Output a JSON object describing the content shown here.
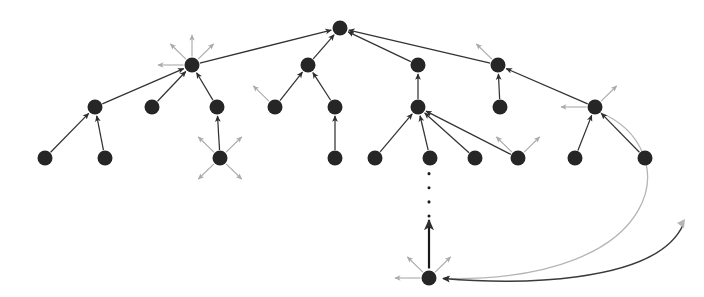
{
  "figure": {
    "title": "",
    "caption": "",
    "type": "directed-graph-tree",
    "background_color": "#ffffff",
    "node_color": "#262626",
    "edge_color_primary": "#333333",
    "edge_color_secondary": "#aaaaaa",
    "dotted_edge_color": "#1a1a1a",
    "curve_edge_color": "#b5b5b5",
    "node_radius": 7.5,
    "width": 704,
    "height": 297
  },
  "graph_data": {
    "type": "node-link-diagram",
    "nodes": [
      {
        "id": "root",
        "label": "",
        "x": 340,
        "y": 28
      },
      {
        "id": "n_l1",
        "label": "",
        "x": 192,
        "y": 65
      },
      {
        "id": "n_c1",
        "label": "",
        "x": 308,
        "y": 65
      },
      {
        "id": "n_r1",
        "label": "",
        "x": 418,
        "y": 65
      },
      {
        "id": "n_r2",
        "label": "",
        "x": 498,
        "y": 65
      },
      {
        "id": "n_l2",
        "label": "",
        "x": 95,
        "y": 107
      },
      {
        "id": "n_l3",
        "label": "",
        "x": 152,
        "y": 107
      },
      {
        "id": "n_l4",
        "label": "",
        "x": 217,
        "y": 107
      },
      {
        "id": "n_c2",
        "label": "",
        "x": 275,
        "y": 107
      },
      {
        "id": "n_c3",
        "label": "",
        "x": 335,
        "y": 107
      },
      {
        "id": "n_h1",
        "label": "",
        "x": 418,
        "y": 107
      },
      {
        "id": "n_r3",
        "label": "",
        "x": 500,
        "y": 107
      },
      {
        "id": "n_h2",
        "label": "",
        "x": 595,
        "y": 107
      },
      {
        "id": "n_b1",
        "label": "",
        "x": 45,
        "y": 158
      },
      {
        "id": "n_b2",
        "label": "",
        "x": 105,
        "y": 158
      },
      {
        "id": "n_b3",
        "label": "",
        "x": 220,
        "y": 158
      },
      {
        "id": "n_b4",
        "label": "",
        "x": 335,
        "y": 158
      },
      {
        "id": "n_b5",
        "label": "",
        "x": 375,
        "y": 158
      },
      {
        "id": "n_b6",
        "label": "",
        "x": 430,
        "y": 158
      },
      {
        "id": "n_b7",
        "label": "",
        "x": 475,
        "y": 158
      },
      {
        "id": "n_b8",
        "label": "",
        "x": 518,
        "y": 158
      },
      {
        "id": "n_b9",
        "label": "",
        "x": 575,
        "y": 158
      },
      {
        "id": "n_b10",
        "label": "",
        "x": 645,
        "y": 158
      },
      {
        "id": "n_deep",
        "label": "",
        "x": 429,
        "y": 278
      }
    ],
    "edges": [
      {
        "from": "n_l1",
        "to": "root",
        "style": "solid",
        "weight": "primary"
      },
      {
        "from": "n_c1",
        "to": "root",
        "style": "solid",
        "weight": "primary"
      },
      {
        "from": "n_r1",
        "to": "root",
        "style": "solid",
        "weight": "primary"
      },
      {
        "from": "n_r2",
        "to": "root",
        "style": "solid",
        "weight": "primary"
      },
      {
        "from": "n_l2",
        "to": "n_l1",
        "style": "solid",
        "weight": "primary"
      },
      {
        "from": "n_l3",
        "to": "n_l1",
        "style": "solid",
        "weight": "primary"
      },
      {
        "from": "n_l4",
        "to": "n_l1",
        "style": "solid",
        "weight": "primary"
      },
      {
        "from": "n_b1",
        "to": "n_l2",
        "style": "solid",
        "weight": "primary"
      },
      {
        "from": "n_b2",
        "to": "n_l2",
        "style": "solid",
        "weight": "primary"
      },
      {
        "from": "n_b3",
        "to": "n_l4",
        "style": "solid",
        "weight": "primary"
      },
      {
        "from": "n_c2",
        "to": "n_c1",
        "style": "solid",
        "weight": "primary"
      },
      {
        "from": "n_c3",
        "to": "n_c1",
        "style": "solid",
        "weight": "primary"
      },
      {
        "from": "n_b4",
        "to": "n_c3",
        "style": "solid",
        "weight": "primary"
      },
      {
        "from": "n_h1",
        "to": "n_r1",
        "style": "solid",
        "weight": "primary"
      },
      {
        "from": "n_b5",
        "to": "n_h1",
        "style": "solid",
        "weight": "primary"
      },
      {
        "from": "n_b6",
        "to": "n_h1",
        "style": "solid",
        "weight": "primary"
      },
      {
        "from": "n_b7",
        "to": "n_h1",
        "style": "solid",
        "weight": "primary"
      },
      {
        "from": "n_b8",
        "to": "n_h1",
        "style": "solid",
        "weight": "primary"
      },
      {
        "from": "n_r3",
        "to": "n_r2",
        "style": "solid",
        "weight": "primary"
      },
      {
        "from": "n_h2",
        "to": "n_r2",
        "style": "solid",
        "weight": "primary"
      },
      {
        "from": "n_b9",
        "to": "n_h2",
        "style": "solid",
        "weight": "primary"
      },
      {
        "from": "n_b10",
        "to": "n_h2",
        "style": "solid",
        "weight": "primary"
      },
      {
        "from": "n_deep",
        "to": "n_b6",
        "style": "dotted",
        "weight": "primary"
      }
    ],
    "loop_edge": {
      "from": "n_h2",
      "to": "n_deep",
      "style": "curved",
      "description": "long curved back-edge looping right and down"
    },
    "frontier_edges": [
      {
        "from": "n_l1",
        "direction": "up-left",
        "weight": "secondary"
      },
      {
        "from": "n_l1",
        "direction": "up",
        "weight": "secondary"
      },
      {
        "from": "n_l1",
        "direction": "up-right",
        "weight": "secondary"
      },
      {
        "from": "n_l1",
        "direction": "left",
        "weight": "secondary"
      },
      {
        "from": "n_c2",
        "direction": "up-left",
        "weight": "secondary"
      },
      {
        "from": "n_b3",
        "direction": "up-left",
        "weight": "secondary"
      },
      {
        "from": "n_b3",
        "direction": "up-right",
        "weight": "secondary"
      },
      {
        "from": "n_b3",
        "direction": "down-left",
        "weight": "secondary"
      },
      {
        "from": "n_b3",
        "direction": "down-right",
        "weight": "secondary"
      },
      {
        "from": "n_r2",
        "direction": "up-left",
        "weight": "secondary"
      },
      {
        "from": "n_b8",
        "direction": "up-left",
        "weight": "secondary"
      },
      {
        "from": "n_b8",
        "direction": "up-right",
        "weight": "secondary"
      },
      {
        "from": "n_h2",
        "direction": "up-right",
        "weight": "secondary"
      },
      {
        "from": "n_h2",
        "direction": "left",
        "weight": "secondary"
      },
      {
        "from": "n_deep",
        "direction": "left",
        "weight": "secondary"
      },
      {
        "from": "n_deep",
        "direction": "up-left",
        "weight": "secondary"
      },
      {
        "from": "n_deep",
        "direction": "up-right",
        "weight": "secondary"
      }
    ]
  }
}
